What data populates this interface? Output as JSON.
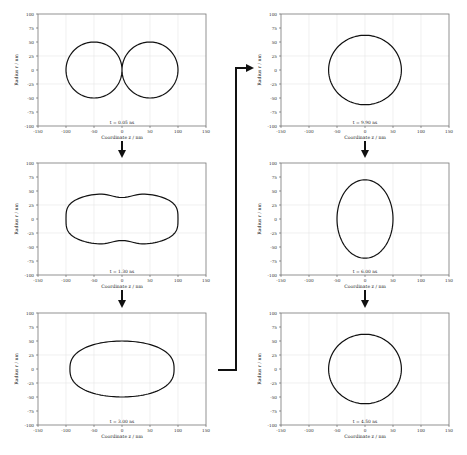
{
  "figure": {
    "x_label": "Coordinate z / nm",
    "y_label": "Radius r / nm",
    "x_ticks": [
      "-150",
      "-100",
      "-50",
      "0",
      "50",
      "100",
      "150"
    ],
    "y_ticks": [
      "100",
      "75",
      "50",
      "25",
      "0",
      "-25",
      "-50",
      "-75",
      "-100"
    ],
    "line_color": "#111111",
    "grid_color": "#e6e6e6"
  },
  "panels": [
    {
      "id": "p1",
      "time_label": "t = 0.05 ns",
      "shape": "two touching circles",
      "x": 38,
      "y": 14
    },
    {
      "id": "p2",
      "time_label": "t = 1.30 ns",
      "shape": "peanut / dumbbell",
      "x": 38,
      "y": 163
    },
    {
      "id": "p3",
      "time_label": "t = 3.00 ns",
      "shape": "horizontal ellipse",
      "x": 38,
      "y": 313
    },
    {
      "id": "p4",
      "time_label": "t = 9.90 ns",
      "shape": "circle",
      "x": 281,
      "y": 14
    },
    {
      "id": "p5",
      "time_label": "t = 6.00 ns",
      "shape": "vertical ellipse",
      "x": 281,
      "y": 163
    },
    {
      "id": "p6",
      "time_label": "t = 4.50 ns",
      "shape": "circle",
      "x": 281,
      "y": 313
    }
  ],
  "flow": {
    "order": [
      "t = 0.05 ns",
      "t = 1.30 ns",
      "t = 3.00 ns",
      "t = 4.50 ns",
      "t = 6.00 ns",
      "t = 9.90 ns"
    ]
  }
}
